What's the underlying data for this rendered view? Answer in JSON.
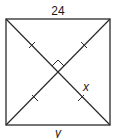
{
  "diagram": {
    "type": "square-with-diagonals",
    "labels": {
      "top_side": "24",
      "half_diagonal": "x",
      "bottom_side": "y"
    },
    "markers": {
      "right_angle_at_center": true,
      "congruent_ticks_on_half_diagonals": 4
    },
    "colors": {
      "stroke": "#2a2a2a",
      "background": "#ffffff"
    }
  }
}
